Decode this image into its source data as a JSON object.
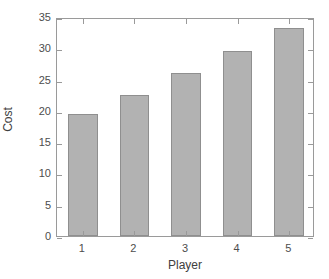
{
  "chart_data": {
    "type": "bar",
    "title": "",
    "xlabel": "Player",
    "ylabel": "Cost",
    "categories": [
      "1",
      "2",
      "3",
      "4",
      "5"
    ],
    "values": [
      19.5,
      22.6,
      26.0,
      29.6,
      33.2
    ],
    "xlim": [
      0.5,
      5.5
    ],
    "ylim": [
      0,
      35
    ],
    "yticks": [
      0,
      5,
      10,
      15,
      20,
      25,
      30,
      35
    ],
    "ytick_labels": [
      "0",
      "5",
      "10",
      "15",
      "20",
      "25",
      "30",
      "35"
    ],
    "xtick_labels": [
      "1",
      "2",
      "3",
      "4",
      "5"
    ],
    "grid": false,
    "legend": false,
    "bar_color": "#b2b2b2",
    "bar_edge_color": "#8f8f8f",
    "axis_color": "#9a9a9a",
    "text_color": "#4d4d4d",
    "background": "#ffffff"
  }
}
